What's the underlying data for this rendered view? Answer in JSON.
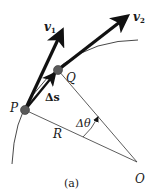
{
  "figure": {
    "caption": "(a)",
    "points": {
      "P": {
        "label": "P",
        "x": 25,
        "y": 110
      },
      "Q": {
        "label": "Q",
        "x": 58,
        "y": 70
      },
      "O": {
        "label": "O",
        "x": 137,
        "y": 162
      }
    },
    "vectors": {
      "v1": {
        "label": "v",
        "subscript": "1",
        "from": "P"
      },
      "v2": {
        "label": "v",
        "subscript": "2",
        "from": "Q"
      },
      "delta_s": {
        "label": "Δs",
        "from": "P",
        "to": "Q"
      }
    },
    "radius_label": "R",
    "angle_label": "Δθ",
    "colors": {
      "vector": "#111111",
      "point": "#555555",
      "line": "#333333"
    }
  }
}
